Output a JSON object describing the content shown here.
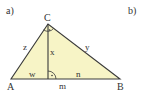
{
  "parts": {
    "a_label": "a)",
    "b_label": "b)"
  },
  "triangle": {
    "fill_color": "#f7f4c6",
    "stroke_color": "#3a3a3a",
    "vertices": {
      "A": "A",
      "B": "B",
      "C": "C"
    },
    "sides": {
      "AC": "z",
      "BC": "y",
      "altitude": "x",
      "AD": "w",
      "DB": "n",
      "base": "m"
    },
    "right_angle_markers": [
      "at C",
      "at foot of altitude"
    ]
  }
}
